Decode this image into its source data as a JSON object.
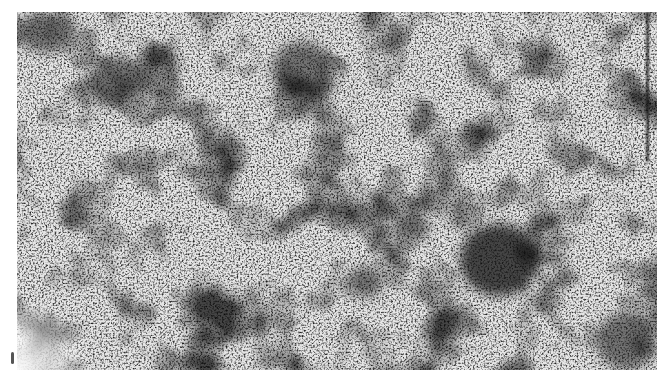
{
  "image": {
    "description": "Grayscale electron micrograph showing granular speckled texture with dark irregular patches",
    "tone": "grayscale",
    "colors": {
      "background": "#ffffff",
      "dark": "#141414",
      "mid": "#8a8a8a",
      "light": "#f0f0f0"
    },
    "features": [
      {
        "name": "large-dark-region",
        "x": 497,
        "y": 262,
        "r": 36
      },
      {
        "name": "dark-patch",
        "x": 110,
        "y": 70,
        "r": 30
      },
      {
        "name": "dark-patch",
        "x": 300,
        "y": 60,
        "r": 28
      },
      {
        "name": "dark-patch",
        "x": 410,
        "y": 220,
        "r": 16
      },
      {
        "name": "dark-patch",
        "x": 360,
        "y": 270,
        "r": 18
      },
      {
        "name": "light-spot",
        "x": 42,
        "y": 318,
        "r": 10
      }
    ]
  }
}
